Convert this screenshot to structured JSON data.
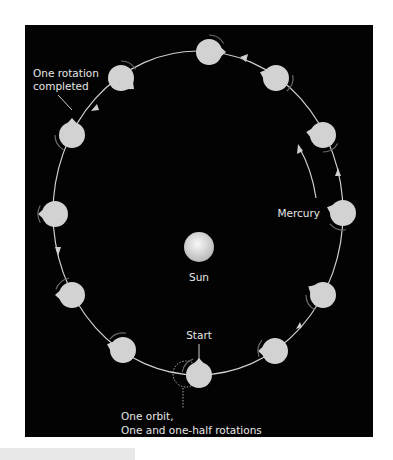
{
  "diagram": {
    "labels": {
      "sun": "Sun",
      "mercury": "Mercury",
      "start": "Start",
      "rotation_line1": "One rotation",
      "rotation_line2": "completed",
      "orbit_line1": "One orbit,",
      "orbit_line2": "One and one-half rotations"
    },
    "colors": {
      "background": "#030303",
      "planet": "#d2d2d2",
      "sun": "#e4e4e4",
      "orbit": "#cfcfcf",
      "text": "#e6e6e6"
    },
    "planet_count": 12
  }
}
